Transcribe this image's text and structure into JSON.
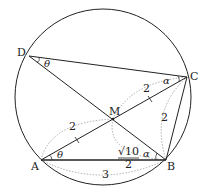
{
  "diagram": {
    "type": "inscribed quadrilateral in circle",
    "points": {
      "A": {
        "label": "A",
        "x": 41,
        "y": 160
      },
      "B": {
        "label": "B",
        "x": 166,
        "y": 160
      },
      "C": {
        "label": "C",
        "x": 187,
        "y": 77
      },
      "D": {
        "label": "D",
        "x": 29,
        "y": 56
      },
      "M": {
        "label": "M",
        "x": 113,
        "y": 119
      }
    },
    "circle": {
      "cx": 103,
      "cy": 97,
      "r": 88
    },
    "angles": {
      "D": "θ",
      "A": "θ",
      "C": "α",
      "B": "α"
    },
    "lengths": {
      "AM": "2",
      "MC": "2",
      "BC": "2",
      "AB": "3",
      "MB_numerator": "√10",
      "MB_denominator": "2"
    },
    "colors": {
      "line": "#222222",
      "dotted": "#999999"
    }
  }
}
